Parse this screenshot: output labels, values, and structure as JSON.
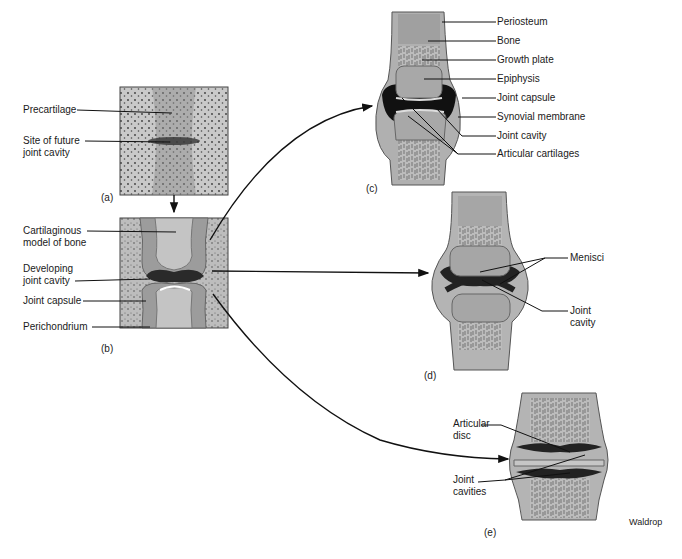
{
  "figure": {
    "credit": "Waldrop",
    "panels": {
      "a": {
        "letter": "(a)",
        "labels": [
          "Precartilage",
          "Site of future",
          "joint cavity"
        ]
      },
      "b": {
        "letter": "(b)",
        "labels": [
          "Cartilaginous",
          "model of bone",
          "Developing",
          "joint cavity",
          "Joint capsule",
          "Perichondrium"
        ]
      },
      "c": {
        "letter": "(c)",
        "labels": [
          "Periosteum",
          "Bone",
          "Growth plate",
          "Epiphysis",
          "Joint capsule",
          "Synovial membrane",
          "Joint cavity",
          "Articular cartilages"
        ]
      },
      "d": {
        "letter": "(d)",
        "labels": [
          "Menisci",
          "Joint",
          "cavity"
        ]
      },
      "e": {
        "letter": "(e)",
        "labels": [
          "Articular",
          "disc",
          "Joint",
          "cavities"
        ]
      }
    }
  }
}
